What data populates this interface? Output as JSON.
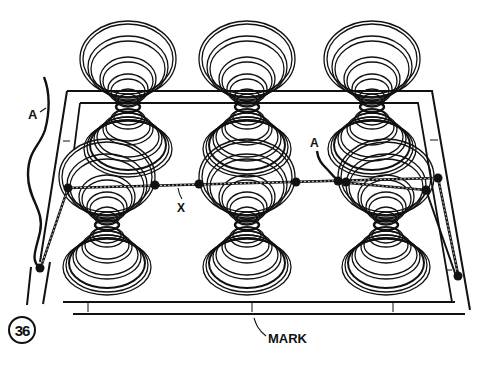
{
  "figure": {
    "number": "36"
  },
  "labels": {
    "a_left": "A",
    "a_right": "A",
    "x": "X",
    "mark": "MARK"
  },
  "colors": {
    "ink": "#111111",
    "paper": "#ffffff"
  },
  "springs": {
    "back_row_centers_x": [
      128,
      247,
      372
    ],
    "front_row_centers_x": [
      107,
      247,
      386
    ]
  }
}
